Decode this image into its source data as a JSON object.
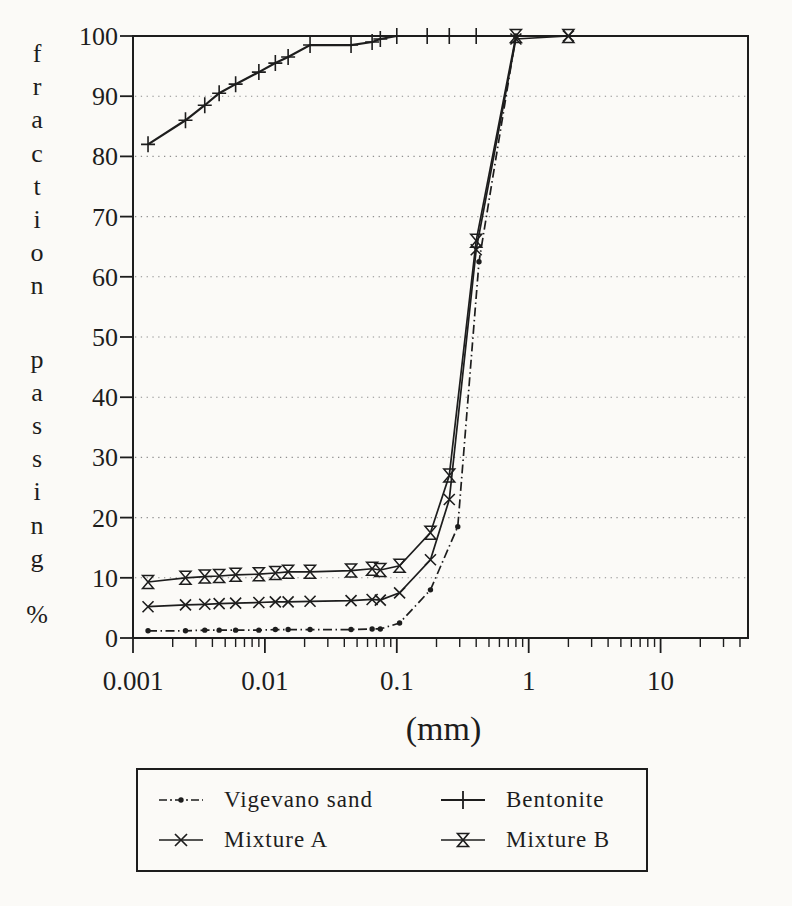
{
  "figure": {
    "background": "#fbfaf7",
    "ink_color": "#1d1d1d",
    "grid_color": "#8f8f8f"
  },
  "chart_data": {
    "type": "line",
    "title": "",
    "xlabel": "(mm)",
    "ylabel": "fraction passing %",
    "x_scale": "log",
    "x_range": [
      0.001,
      46
    ],
    "y_range": [
      0,
      100
    ],
    "y_ticks": [
      0,
      10,
      20,
      30,
      40,
      50,
      60,
      70,
      80,
      90,
      100
    ],
    "x_major_ticks": [
      0.001,
      0.01,
      0.1,
      1,
      10
    ],
    "x_tick_labels": [
      "0.001",
      "0.01",
      "0.1",
      "1",
      "10"
    ],
    "grid": "horizontal dotted lines at each 10%",
    "legend_position": "below chart",
    "series": [
      {
        "name": "Vigevano sand",
        "marker": "dot",
        "line_style": "dashdot",
        "points": [
          [
            0.0013,
            1.2
          ],
          [
            0.0025,
            1.2
          ],
          [
            0.0035,
            1.3
          ],
          [
            0.0045,
            1.3
          ],
          [
            0.006,
            1.3
          ],
          [
            0.009,
            1.3
          ],
          [
            0.012,
            1.4
          ],
          [
            0.015,
            1.4
          ],
          [
            0.022,
            1.4
          ],
          [
            0.045,
            1.4
          ],
          [
            0.065,
            1.5
          ],
          [
            0.075,
            1.5
          ],
          [
            0.105,
            2.5
          ],
          [
            0.18,
            8
          ],
          [
            0.29,
            18.5
          ],
          [
            0.42,
            62.5
          ],
          [
            0.8,
            100
          ]
        ]
      },
      {
        "name": "Bentonite",
        "marker": "plus",
        "line_style": "solid",
        "points": [
          [
            0.0013,
            82
          ],
          [
            0.0025,
            86
          ],
          [
            0.0035,
            88.5
          ],
          [
            0.0045,
            90.5
          ],
          [
            0.006,
            92
          ],
          [
            0.009,
            94
          ],
          [
            0.012,
            95.5
          ],
          [
            0.015,
            96.5
          ],
          [
            0.022,
            98.5
          ],
          [
            0.045,
            98.5
          ],
          [
            0.065,
            99
          ],
          [
            0.075,
            99.5
          ],
          [
            0.1,
            100
          ],
          [
            0.17,
            100
          ],
          [
            0.25,
            100
          ],
          [
            0.4,
            100
          ]
        ]
      },
      {
        "name": "Mixture A",
        "marker": "x",
        "line_style": "solid",
        "points": [
          [
            0.0013,
            5.2
          ],
          [
            0.0025,
            5.5
          ],
          [
            0.0035,
            5.6
          ],
          [
            0.0045,
            5.7
          ],
          [
            0.006,
            5.8
          ],
          [
            0.009,
            5.9
          ],
          [
            0.012,
            6
          ],
          [
            0.015,
            6
          ],
          [
            0.022,
            6.1
          ],
          [
            0.045,
            6.2
          ],
          [
            0.065,
            6.4
          ],
          [
            0.075,
            6.3
          ],
          [
            0.105,
            7.5
          ],
          [
            0.18,
            13
          ],
          [
            0.25,
            23
          ],
          [
            0.4,
            64.5
          ],
          [
            0.8,
            99.5
          ],
          [
            2,
            100
          ]
        ]
      },
      {
        "name": "Mixture B",
        "marker": "hourglass",
        "line_style": "solid",
        "points": [
          [
            0.0013,
            9.3
          ],
          [
            0.0025,
            10
          ],
          [
            0.0035,
            10.2
          ],
          [
            0.0045,
            10.3
          ],
          [
            0.006,
            10.5
          ],
          [
            0.009,
            10.6
          ],
          [
            0.012,
            10.8
          ],
          [
            0.015,
            11
          ],
          [
            0.022,
            11
          ],
          [
            0.045,
            11.2
          ],
          [
            0.065,
            11.5
          ],
          [
            0.075,
            11.3
          ],
          [
            0.105,
            12
          ],
          [
            0.18,
            17.5
          ],
          [
            0.25,
            27
          ],
          [
            0.4,
            66
          ],
          [
            0.8,
            100
          ],
          [
            2,
            100
          ]
        ]
      }
    ]
  },
  "legend": {
    "entries": [
      {
        "label": "Vigevano sand",
        "marker": "dot"
      },
      {
        "label": "Bentonite",
        "marker": "plus"
      },
      {
        "label": "Mixture A",
        "marker": "x"
      },
      {
        "label": "Mixture B",
        "marker": "hourglass"
      }
    ]
  }
}
